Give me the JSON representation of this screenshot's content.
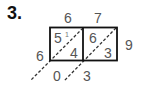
{
  "problem": {
    "number_label": "3.",
    "top_digits": [
      "6",
      "7"
    ],
    "right_digit": "9",
    "left_digit": "6",
    "cells": [
      {
        "tens": "5",
        "ones": "4",
        "carry": "1"
      },
      {
        "tens": "6",
        "ones": "3"
      }
    ],
    "bottom_digits": [
      "0",
      "3"
    ]
  },
  "colors": {
    "grid_line": "#111111",
    "digit": "#555555",
    "diagonal": "#333333"
  }
}
